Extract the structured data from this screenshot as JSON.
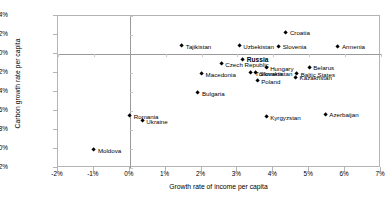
{
  "chart_data": {
    "type": "scatter",
    "title": "",
    "xlabel": "Growth rate of income per capita",
    "ylabel": "Carbon growth rate per capita",
    "xlim": [
      -2,
      7
    ],
    "ylim": [
      -12,
      4
    ],
    "xticks": [
      "-2%",
      "-1%",
      "0%",
      "1%",
      "2%",
      "3%",
      "4%",
      "5%",
      "6%",
      "7%"
    ],
    "xtick_values": [
      -2,
      -1,
      0,
      1,
      2,
      3,
      4,
      5,
      6,
      7
    ],
    "yticks": [
      "4%",
      "2%",
      "0%",
      "-2%",
      "-4%",
      "-6%",
      "-8%",
      "-10%",
      "-12%"
    ],
    "ytick_values": [
      4,
      2,
      0,
      -2,
      -4,
      -6,
      -8,
      -10,
      -12
    ],
    "grid": false,
    "legend": "none",
    "marker": "diamond",
    "marker_color": "#000000",
    "points": [
      {
        "label": "Tajikistan",
        "x": 1.45,
        "y": 0.85,
        "lpos": "right",
        "bold": false
      },
      {
        "label": "Uzbekistan",
        "x": 3.05,
        "y": 0.85,
        "lpos": "right",
        "bold": false
      },
      {
        "label": "Croatia",
        "x": 4.35,
        "y": 2.3,
        "lpos": "right",
        "bold": false
      },
      {
        "label": "Slovenia",
        "x": 4.15,
        "y": 0.8,
        "lpos": "right",
        "bold": false
      },
      {
        "label": "Armenia",
        "x": 5.8,
        "y": 0.8,
        "lpos": "right",
        "bold": false
      },
      {
        "label": "Russia",
        "x": 3.15,
        "y": -0.55,
        "lpos": "right",
        "bold": true
      },
      {
        "label": "Czech Republic",
        "x": 2.55,
        "y": -1.05,
        "lpos": "right",
        "bold": false
      },
      {
        "label": "Macedonia",
        "x": 2.0,
        "y": -2.1,
        "lpos": "right",
        "bold": false
      },
      {
        "label": "Hungary",
        "x": 3.8,
        "y": -1.45,
        "lpos": "right",
        "bold": false
      },
      {
        "label": "Slovakia",
        "x": 3.5,
        "y": -1.95,
        "lpos": "right",
        "bold": false
      },
      {
        "label": "Turkmenistan",
        "x": 3.38,
        "y": -1.95,
        "lpos": "right",
        "bold": false
      },
      {
        "label": "Belarus",
        "x": 5.0,
        "y": -1.4,
        "lpos": "right",
        "bold": false
      },
      {
        "label": "Baltic States",
        "x": 4.65,
        "y": -2.1,
        "lpos": "right",
        "bold": false
      },
      {
        "label": "Kazakhstan",
        "x": 4.62,
        "y": -2.45,
        "lpos": "right",
        "bold": false
      },
      {
        "label": "Poland",
        "x": 3.55,
        "y": -2.85,
        "lpos": "right",
        "bold": false
      },
      {
        "label": "Bulgaria",
        "x": 1.9,
        "y": -4.1,
        "lpos": "right",
        "bold": false
      },
      {
        "label": "Kyrgyzstan",
        "x": 3.8,
        "y": -6.6,
        "lpos": "right",
        "bold": false
      },
      {
        "label": "Azerbaijan",
        "x": 5.45,
        "y": -6.35,
        "lpos": "right",
        "bold": false
      },
      {
        "label": "Romania",
        "x": 0.0,
        "y": -6.5,
        "lpos": "right",
        "bold": false
      },
      {
        "label": "Ukraine",
        "x": 0.35,
        "y": -7.0,
        "lpos": "right",
        "bold": false
      },
      {
        "label": "Moldova",
        "x": -1.0,
        "y": -10.1,
        "lpos": "right",
        "bold": false
      }
    ]
  }
}
